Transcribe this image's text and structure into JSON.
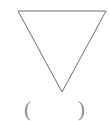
{
  "figure": {
    "name": "inverted-triangle-with-answer-blank",
    "background_color": "#ffffff",
    "width": 109,
    "height": 121,
    "shape": {
      "name": "triangle",
      "orientation": "pointing-down",
      "stroke_color": "#6e6e6e",
      "stroke_width": 1,
      "fill": "none",
      "vertices_label": "18,11 106,11 62,92",
      "points": [
        {
          "x": 18,
          "y": 11
        },
        {
          "x": 106,
          "y": 11
        },
        {
          "x": 62,
          "y": 92
        }
      ]
    },
    "answer_blank": {
      "open_paren": "(",
      "close_paren": ")",
      "value": "",
      "placeholder": "",
      "text_color": "#8c8c8c"
    }
  }
}
